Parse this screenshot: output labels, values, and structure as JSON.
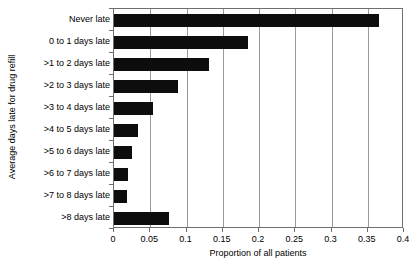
{
  "chart_data": {
    "type": "bar",
    "orientation": "horizontal",
    "title": "",
    "xlabel": "Proportion of all patients",
    "ylabel": "Average days late for drug refill",
    "categories": [
      "Never late",
      "0 to 1 days late",
      ">1 to 2 days late",
      ">2 to 3 days late",
      ">3 to 4 days late",
      ">4 to 5 days late",
      ">5 to 6 days late",
      ">6 to 7 days late",
      ">7 to 8 days late",
      ">8 days late"
    ],
    "values": [
      0.365,
      0.185,
      0.131,
      0.088,
      0.054,
      0.033,
      0.025,
      0.019,
      0.018,
      0.076
    ],
    "xlim": [
      0,
      0.4
    ],
    "xticks": [
      0,
      0.05,
      0.1,
      0.15,
      0.2,
      0.25,
      0.3,
      0.35,
      0.4
    ],
    "xtick_labels": [
      "0",
      "0.05",
      "0.1",
      "0.15",
      "0.2",
      "0.25",
      "0.3",
      "0.35",
      "0.4"
    ],
    "grid": "vertical",
    "legend": "none",
    "bar_color": "#0d0d0d",
    "gridline_color": "#9a9a9a",
    "axis_color": "#6e6e6e",
    "background_color": "#ffffff"
  }
}
